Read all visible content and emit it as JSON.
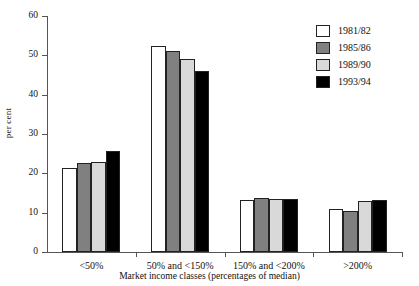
{
  "chart_data": {
    "type": "bar",
    "title": "",
    "xlabel": "Market income classes (percentages of median)",
    "ylabel": "per cent",
    "categories": [
      "<50%",
      "50% and <150%",
      "150% and <200%",
      ">200%"
    ],
    "ylim": [
      0,
      60
    ],
    "yticks": [
      0,
      10,
      20,
      30,
      40,
      50,
      60
    ],
    "grid": false,
    "legend_position": "top-right",
    "series": [
      {
        "name": "1981/82",
        "color": "#ffffff",
        "values": [
          21.4,
          52.5,
          13.2,
          11.0
        ]
      },
      {
        "name": "1985/86",
        "color": "#808080",
        "values": [
          22.6,
          51.0,
          13.8,
          10.5
        ]
      },
      {
        "name": "1989/90",
        "color": "#d9d9d9",
        "values": [
          23.0,
          49.0,
          13.4,
          13.0
        ]
      },
      {
        "name": "1993/94",
        "color": "#000000",
        "values": [
          25.7,
          46.0,
          13.5,
          13.2
        ]
      }
    ]
  },
  "axis": {
    "y_tick_labels": [
      "0",
      "10",
      "20",
      "30",
      "40",
      "50",
      "60"
    ]
  }
}
